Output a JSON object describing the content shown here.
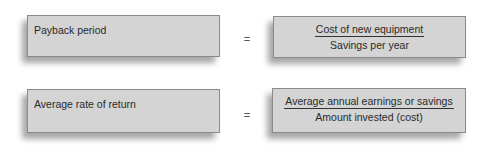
{
  "rows": [
    {
      "label": "Payback period",
      "equals": "=",
      "numerator": "Cost of new equipment",
      "denominator": "Savings per year"
    },
    {
      "label": "Average rate of return",
      "equals": "=",
      "numerator": "Average annual earnings or savings",
      "denominator": "Amount invested (cost)"
    }
  ],
  "colors": {
    "box_fill": "#d4d4d4",
    "box_border": "#8a8a8a",
    "text": "#2a2a2a"
  }
}
